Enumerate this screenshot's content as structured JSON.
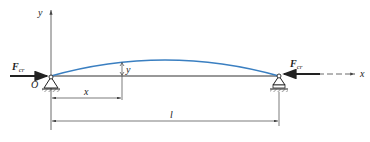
{
  "diagram": {
    "type": "euler column buckling (pinned-pinned beam)",
    "labels": {
      "y_axis": "y",
      "x_axis": "x",
      "origin": "O",
      "force_main": "F",
      "force_sub": "cr",
      "deflection": "y",
      "position": "x",
      "length": "l"
    },
    "colors": {
      "curve": "#3a7fc1",
      "beam": "#333333",
      "lines": "#444444"
    }
  }
}
